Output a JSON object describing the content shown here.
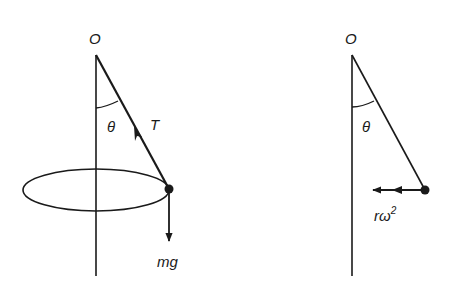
{
  "diagrams": {
    "left": {
      "title": "conical pendulum - forces",
      "pivot_label": "O",
      "angle_label": "θ",
      "tension_label": "T",
      "weight_label": "mg"
    },
    "right": {
      "title": "conical pendulum - acceleration",
      "pivot_label": "O",
      "angle_label": "θ",
      "acceleration_label_base": "rω",
      "acceleration_label_sup": "2"
    }
  },
  "colors": {
    "ink": "#1a1a1a",
    "background": "#ffffff"
  }
}
